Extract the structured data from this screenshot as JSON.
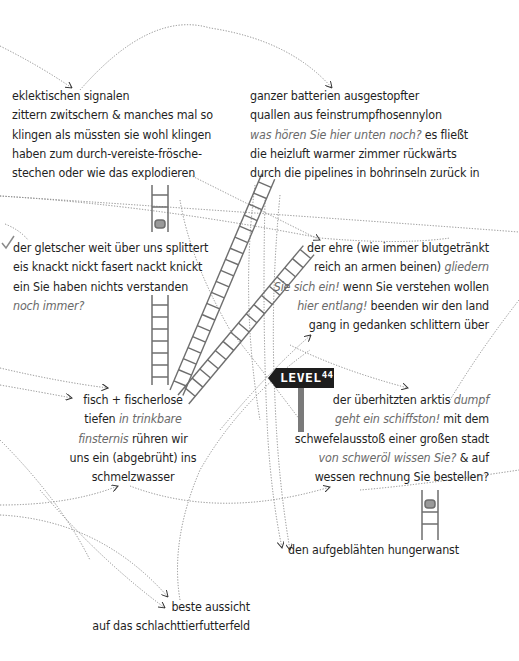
{
  "stanzas": {
    "s1": {
      "lines": [
        "eklektischen signalen",
        "zittern zwitschern & manches mal so",
        "klingen als müssten sie wohl klingen",
        "haben zum durch-vereiste-frösche-",
        "stechen oder wie das explodieren"
      ]
    },
    "s2": {
      "l1": "ganzer batterien ausgestopfter",
      "l2": "quallen aus feinstrumpfhosennylon",
      "l3_italic": "was hören Sie hier unten noch?",
      "l3_plain": " es fließt",
      "l4": "die heizluft warmer zimmer rückwärts",
      "l5": "durch die pipelines in bohrinseln zurück in"
    },
    "s3": {
      "l1": "der gletscher weit über uns splittert",
      "l2": "eis knackt nickt fasert nackt knickt",
      "l3": "ein Sie haben nichts verstanden",
      "l4_italic": "noch immer?"
    },
    "s4": {
      "l1": "der ehre (wie immer blutgetränkt",
      "l2_plain": "reich an armen beinen) ",
      "l2_italic": "gliedern",
      "l3_italic": "Sie sich ein!",
      "l3_plain": " wenn Sie verstehen wollen",
      "l4_italic": "hier entlang!",
      "l4_plain": " beenden wir den land",
      "l5": "gang in gedanken schlittern über"
    },
    "s5": {
      "l1": "fisch + fischerlose",
      "l2_plain": "tiefen ",
      "l2_italic": "in trinkbare",
      "l3_italic": "finsternis",
      "l3_plain": " rühren wir",
      "l4": "uns ein (abgebrüht) ins",
      "l5": "schmelzwasser"
    },
    "s6": {
      "l1_plain": "der überhitzten arktis ",
      "l1_italic": "dumpf",
      "l2_italic": "geht ein schiffston!",
      "l2_plain": " mit dem",
      "l3": "schwefelausstoß einer großen stadt",
      "l4_italic": "von schweröl wissen Sie?",
      "l4_plain": " & auf",
      "l5": "wessen rechnung Sie bestellen?"
    },
    "s7": {
      "l1": "den aufgeblähten hungerwanst"
    },
    "s8": {
      "l1": "beste aussicht",
      "l2": "auf das schlachttierfutterfeld"
    }
  },
  "sign": {
    "word": "LEVEL",
    "number": "44",
    "board_color": "#1d1d1d",
    "post_color": "#7a7a7a"
  },
  "icons": [
    "ladder-icon",
    "arrow-icon",
    "signpost-icon",
    "checkmark-icon"
  ],
  "colors": {
    "text": "#1f1f1f",
    "italic": "#6a6a6a",
    "lines": "#8a8a8a",
    "ladder": "#6e6e6e"
  }
}
